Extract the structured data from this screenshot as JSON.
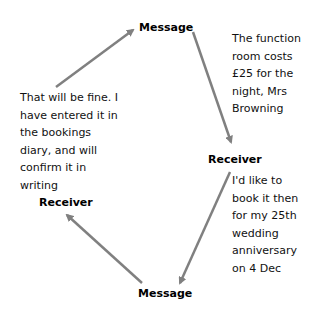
{
  "nodes": {
    "message_top": "Message",
    "receiver_right": "Receiver",
    "message_bottom": "Message",
    "receiver_left": "Receiver"
  },
  "messages": {
    "top_right": "The function room costs £25 for the night, Mrs Browning",
    "bottom_right": "I'd like to book it then for my 25th wedding anniversary on 4 Dec",
    "left": "That will be fine. I have entered it in the bookings diary, and will confirm it in writing"
  },
  "colors": {
    "arrow": "#808080"
  }
}
